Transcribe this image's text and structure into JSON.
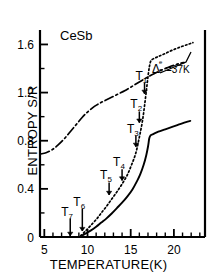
{
  "figure": {
    "sample_label": "CeSb",
    "annotation_label": "Δ₀ = 37K",
    "annotation_delta": "Δ",
    "annotation_sub": "0",
    "annotation_sup": "e",
    "annotation_rest": "=37K"
  },
  "axes": {
    "xlabel": "TEMPERATURE(K)",
    "ylabel": "ENTROPY S/R",
    "xticklabels": [
      "5",
      "10",
      "15",
      "20"
    ],
    "yticklabels": [
      "0",
      "0.4",
      "0.8",
      "1.2",
      "1.6"
    ]
  },
  "markers": {
    "t1": {
      "base": "T",
      "sub": "1"
    },
    "t2": {
      "base": "T",
      "sub": "2"
    },
    "t3": {
      "base": "T",
      "sub": "3"
    },
    "t4": {
      "base": "T",
      "sub": "4"
    },
    "t5": {
      "base": "T",
      "sub": "5"
    },
    "t6": {
      "base": "T",
      "sub": "6"
    },
    "t7": {
      "base": "T",
      "sub": "7"
    }
  },
  "chart_data": {
    "type": "line",
    "title": "CeSb",
    "xlabel": "TEMPERATURE(K)",
    "ylabel": "ENTROPY S/R",
    "xlim": [
      4.5,
      23.6
    ],
    "ylim": [
      0,
      1.72
    ],
    "xticks": [
      5,
      10,
      15,
      20
    ],
    "yticks": [
      0,
      0.4,
      0.8,
      1.2,
      1.6
    ],
    "xminortick_step": 1,
    "yminortick_step": 0.2,
    "grid": false,
    "legend": false,
    "annotations": [
      {
        "text": "CeSb",
        "x": 8.2,
        "y": 1.58
      },
      {
        "text": "Δ₀ = 37K",
        "x": 18.9,
        "y": 1.24
      }
    ],
    "transition_markers": [
      {
        "label": "T1",
        "x": 16.6,
        "y_label": 1.3,
        "y_tip": 1.19
      },
      {
        "label": "T2",
        "x": 16.0,
        "y_label": 1.06,
        "y_tip": 0.95
      },
      {
        "label": "T3",
        "x": 15.6,
        "y_label": 0.86,
        "y_tip": 0.75
      },
      {
        "label": "T4",
        "x": 14.0,
        "y_label": 0.58,
        "y_tip": 0.47
      },
      {
        "label": "T5",
        "x": 12.5,
        "y_label": 0.47,
        "y_tip": 0.35
      },
      {
        "label": "T6",
        "x": 9.4,
        "y_label": 0.25,
        "y_tip": 0.05
      },
      {
        "label": "T7",
        "x": 8.0,
        "y_label": 0.17,
        "y_tip": 0.01
      }
    ],
    "series": [
      {
        "name": "magnetic entropy (solid)",
        "style": "solid",
        "x": [
          9.3,
          9.8,
          10.4,
          11.0,
          11.6,
          12.2,
          12.8,
          13.4,
          14.0,
          14.6,
          15.2,
          15.7,
          16.1,
          16.5,
          16.8,
          17.0,
          17.15,
          17.3,
          17.6,
          18.2,
          19.0,
          19.8,
          20.6,
          21.4,
          21.9
        ],
        "y": [
          0.01,
          0.03,
          0.055,
          0.085,
          0.12,
          0.155,
          0.195,
          0.24,
          0.285,
          0.335,
          0.395,
          0.46,
          0.52,
          0.6,
          0.68,
          0.75,
          0.82,
          0.845,
          0.855,
          0.875,
          0.895,
          0.915,
          0.935,
          0.955,
          0.965
        ]
      },
      {
        "name": "total entropy (dotted)",
        "style": "dotted",
        "x": [
          9.2,
          9.7,
          10.3,
          11.0,
          11.6,
          12.2,
          12.8,
          13.4,
          14.0,
          14.6,
          15.1,
          15.6,
          16.0,
          16.35,
          16.6,
          16.85,
          17.05,
          17.2,
          17.35,
          17.6,
          18.2,
          19.0,
          19.9,
          20.8,
          21.6,
          22.2
        ],
        "y": [
          0.01,
          0.045,
          0.09,
          0.145,
          0.2,
          0.255,
          0.315,
          0.375,
          0.44,
          0.515,
          0.6,
          0.7,
          0.83,
          0.96,
          1.09,
          1.24,
          1.36,
          1.43,
          1.465,
          1.48,
          1.5,
          1.525,
          1.555,
          1.58,
          1.6,
          1.615
        ]
      },
      {
        "name": "calculated entropy (dash-dot)",
        "style": "dashdot",
        "x": [
          4.6,
          5.2,
          5.9,
          6.6,
          7.3,
          8.0,
          8.7,
          9.4,
          10.1,
          10.8,
          11.5,
          12.2,
          12.9,
          13.6,
          14.3,
          15.0,
          15.7,
          16.4,
          17.1,
          17.8,
          18.5,
          19.2,
          19.9,
          20.6,
          21.2
        ],
        "y": [
          0.69,
          0.7,
          0.725,
          0.765,
          0.815,
          0.875,
          0.935,
          0.995,
          1.045,
          1.085,
          1.115,
          1.14,
          1.165,
          1.19,
          1.215,
          1.245,
          1.275,
          1.305,
          1.335,
          1.36,
          1.385,
          1.405,
          1.425,
          1.44,
          1.45
        ]
      }
    ]
  }
}
